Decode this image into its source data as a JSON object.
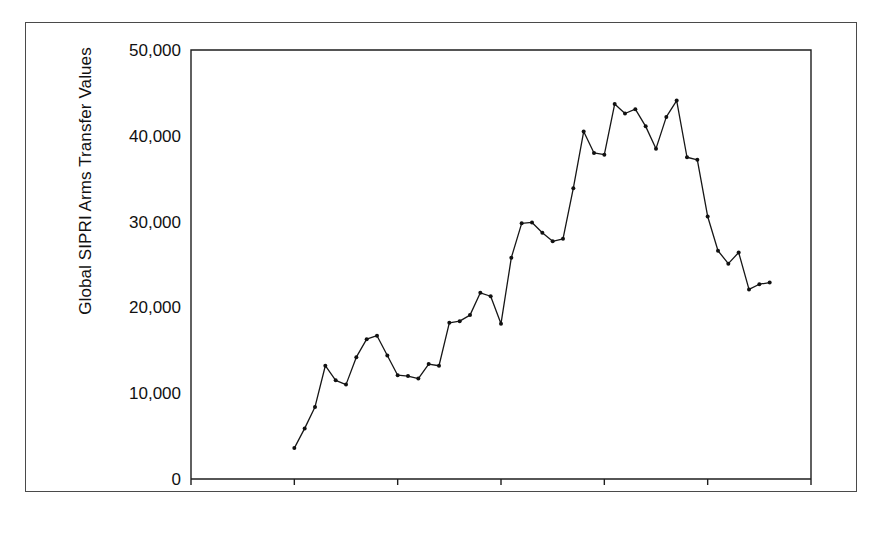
{
  "figure": {
    "background_color": "#ffffff",
    "frame_color": "#4a4a4a",
    "line_color": "#161616"
  },
  "chart_data": {
    "type": "line",
    "title": "",
    "subtitle": "",
    "xlabel": "",
    "ylabel": "Global SIPRI Arms Transfer Values",
    "xlim": [
      1940,
      2000
    ],
    "ylim": [
      0,
      50000
    ],
    "xticks": [
      1940,
      1950,
      1960,
      1970,
      1980,
      1990,
      2000
    ],
    "xtick_labels": [
      "1940",
      "1950",
      "1960",
      "1970",
      "1980",
      "1990",
      "2000"
    ],
    "yticks": [
      0,
      10000,
      20000,
      30000,
      40000,
      50000
    ],
    "ytick_labels": [
      "0",
      "10,000",
      "20,000",
      "30,000",
      "40,000",
      "50,000"
    ],
    "grid": false,
    "legend": false,
    "legend_position": "none",
    "markers": "filled-circle",
    "series": [
      {
        "name": "Global SIPRI Arms Transfer Values",
        "color": "#161616",
        "x": [
          1950,
          1951,
          1952,
          1953,
          1954,
          1955,
          1956,
          1957,
          1958,
          1959,
          1960,
          1961,
          1962,
          1963,
          1964,
          1965,
          1966,
          1967,
          1968,
          1969,
          1970,
          1971,
          1972,
          1973,
          1974,
          1975,
          1976,
          1977,
          1978,
          1979,
          1980,
          1981,
          1982,
          1983,
          1984,
          1985,
          1986,
          1987,
          1988,
          1989,
          1990,
          1991,
          1992,
          1993,
          1994,
          1995,
          1996
        ],
        "values": [
          3600,
          5900,
          8400,
          13200,
          11500,
          11000,
          14200,
          16300,
          16700,
          14400,
          12100,
          12000,
          11700,
          13400,
          13200,
          18200,
          18400,
          19100,
          21700,
          21300,
          18100,
          25800,
          29800,
          29900,
          28700,
          27700,
          28000,
          33900,
          40500,
          38000,
          37800,
          43700,
          42600,
          43100,
          41100,
          38500,
          42200,
          44100,
          37500,
          37200,
          30600,
          26600,
          25100,
          26400,
          22100,
          22700,
          22900
        ]
      }
    ]
  }
}
